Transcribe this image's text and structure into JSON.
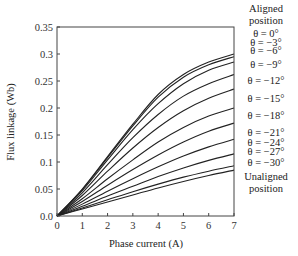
{
  "chart_data": {
    "type": "line",
    "title": "",
    "xlabel": "Phase current (A)",
    "ylabel": "Flux linkage (Wb)",
    "xlim": [
      0,
      7
    ],
    "ylim": [
      0,
      0.35
    ],
    "xticks": [
      "0",
      "1",
      "2",
      "3",
      "4",
      "5",
      "6",
      "7"
    ],
    "yticks": [
      "0.0",
      "0.05",
      "0.1",
      "0.15",
      "0.2",
      "0.25",
      "0.3",
      "0.35"
    ],
    "grid": false,
    "x": [
      0,
      1,
      2,
      3,
      4,
      5,
      6,
      7
    ],
    "series": [
      {
        "name": "θ = 0°",
        "values": [
          0,
          0.05,
          0.11,
          0.17,
          0.225,
          0.262,
          0.285,
          0.3
        ]
      },
      {
        "name": "θ = −3°",
        "values": [
          0,
          0.049,
          0.108,
          0.167,
          0.22,
          0.257,
          0.28,
          0.295
        ]
      },
      {
        "name": "θ = −6°",
        "values": [
          0,
          0.047,
          0.104,
          0.16,
          0.208,
          0.245,
          0.27,
          0.285
        ]
      },
      {
        "name": "θ = −9°",
        "values": [
          0,
          0.043,
          0.095,
          0.145,
          0.188,
          0.222,
          0.245,
          0.262
        ]
      },
      {
        "name": "θ = −12°",
        "values": [
          0,
          0.038,
          0.083,
          0.126,
          0.164,
          0.195,
          0.218,
          0.235
        ]
      },
      {
        "name": "θ = −15°",
        "values": [
          0,
          0.032,
          0.069,
          0.104,
          0.137,
          0.164,
          0.185,
          0.2
        ]
      },
      {
        "name": "θ = −18°",
        "values": [
          0,
          0.027,
          0.057,
          0.086,
          0.113,
          0.137,
          0.157,
          0.172
        ]
      },
      {
        "name": "θ = −21°",
        "values": [
          0,
          0.022,
          0.046,
          0.069,
          0.091,
          0.111,
          0.128,
          0.142
        ]
      },
      {
        "name": "θ = −24°",
        "values": [
          0,
          0.018,
          0.037,
          0.055,
          0.073,
          0.089,
          0.103,
          0.115
        ]
      },
      {
        "name": "θ = −27°",
        "values": [
          0,
          0.015,
          0.03,
          0.045,
          0.059,
          0.072,
          0.083,
          0.093
        ]
      },
      {
        "name": "θ = −30°",
        "values": [
          0,
          0.013,
          0.026,
          0.039,
          0.052,
          0.064,
          0.075,
          0.085
        ]
      }
    ],
    "annotations": {
      "top": [
        "Aligned",
        "position"
      ],
      "bottom": [
        "Unaligned",
        "position"
      ],
      "label_y": [
        0.3,
        0.291,
        0.28,
        0.262,
        0.235,
        0.2,
        0.172,
        0.142,
        0.118,
        0.097,
        0.075
      ]
    }
  }
}
